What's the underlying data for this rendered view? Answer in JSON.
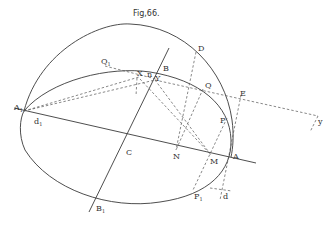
{
  "figure": {
    "title": "Fig,66.",
    "labels": {
      "A1": "A",
      "A1_sub": "1",
      "d1": "d",
      "d1_sub": "1",
      "Q1": "Q",
      "Q1_sub": "1",
      "X": "X",
      "n": "n",
      "Y": "Y",
      "B": "B",
      "D": "D",
      "Q": "Q",
      "E": "E",
      "y": "y",
      "P": "P",
      "C": "C",
      "N": "N",
      "M": "M",
      "A": "A",
      "P1": "P",
      "P1_sub": "1",
      "d": "d",
      "B1": "B",
      "B1_sub": "1"
    }
  }
}
